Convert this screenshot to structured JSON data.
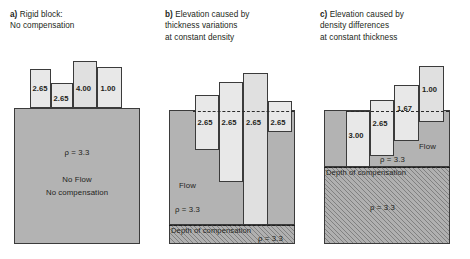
{
  "figure": {
    "width": 470,
    "height": 259,
    "colors": {
      "mantle_fill": "#b3b3b3",
      "block_fill": "#e2e2e2",
      "outline": "#3b3b3b",
      "text": "#231f20"
    }
  },
  "panels": [
    {
      "id": "a",
      "caption_label": "a)",
      "caption_lines": [
        "Rigid block:",
        "No compensation"
      ],
      "substratum": {
        "density_label": "ρ = 3.3",
        "notes": [
          "No Flow",
          "No compensation"
        ],
        "hatched": false
      },
      "sea_level_line": false,
      "depth_of_compensation_line": false,
      "blocks": [
        {
          "label": "2.65",
          "density": 2.65
        },
        {
          "label": "2.65",
          "density": 2.65
        },
        {
          "label": "4.00",
          "density": 4.0
        },
        {
          "label": "1.00",
          "density": 1.0
        }
      ]
    },
    {
      "id": "b",
      "caption_label": "b)",
      "caption_lines": [
        "Elevation caused by",
        "thickness variations",
        "at constant density"
      ],
      "substratum": {
        "density_label": "ρ = 3.3",
        "flow_label": "Flow",
        "deep_density_label": "ρ = 3.3",
        "hatched": true
      },
      "sea_level_line": true,
      "depth_of_compensation_label": "Depth of compensation",
      "blocks": [
        {
          "label": "2.65",
          "density": 2.65
        },
        {
          "label": "2.65",
          "density": 2.65
        },
        {
          "label": "2.65",
          "density": 2.65
        },
        {
          "label": "2.65",
          "density": 2.65
        }
      ]
    },
    {
      "id": "c",
      "caption_label": "c)",
      "caption_lines": [
        "Elevation caused by",
        "density differences",
        "at constant thickness"
      ],
      "substratum": {
        "density_label": "ρ = 3.3",
        "flow_label": "Flow",
        "deep_density_label": "ρ = 3.3",
        "hatched": true
      },
      "sea_level_line": true,
      "depth_of_compensation_label": "Depth of compensation",
      "blocks": [
        {
          "label": "3.00",
          "density": 3.0
        },
        {
          "label": "2.65",
          "density": 2.65
        },
        {
          "label": "1.67",
          "density": 1.67
        },
        {
          "label": "1.00",
          "density": 1.0
        }
      ]
    }
  ]
}
